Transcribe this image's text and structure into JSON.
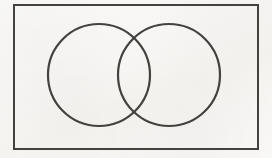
{
  "figure": {
    "kind": "venn-diagram",
    "caption": "",
    "width": 272,
    "height": 158,
    "background_color": "#f7f6f3",
    "stroke_color": "#45413f",
    "frame": {
      "label": "",
      "x": 14,
      "y": 5,
      "width": 244,
      "height": 144,
      "stroke_width": 2,
      "fill": "none"
    },
    "circles": [
      {
        "label": "",
        "name": "left-set",
        "cx": 99,
        "cy": 75,
        "r": 51,
        "stroke_width": 2.2,
        "fill": "none"
      },
      {
        "label": "",
        "name": "right-set",
        "cx": 169,
        "cy": 75,
        "r": 51,
        "stroke_width": 2.2,
        "fill": "none"
      }
    ],
    "intersection_points": [
      {
        "x": 134,
        "y": 27
      },
      {
        "x": 134,
        "y": 123
      }
    ],
    "region_labels": []
  }
}
